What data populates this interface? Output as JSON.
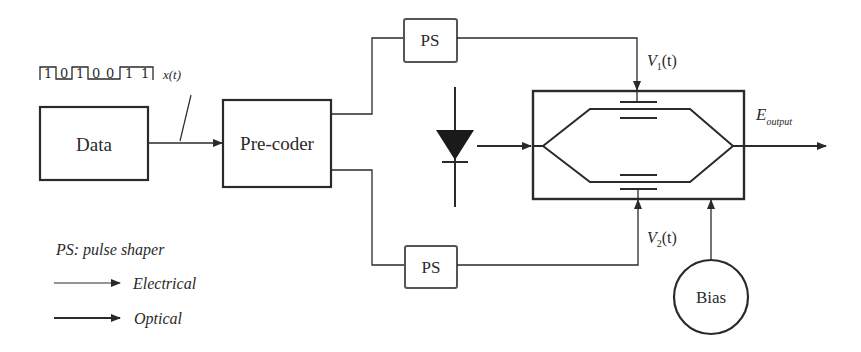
{
  "blocks": {
    "data": "Data",
    "precoder": "Pre-coder",
    "ps_top": "PS",
    "ps_bottom": "PS",
    "bias": "Bias"
  },
  "signals": {
    "bit_sequence": [
      "1",
      "0",
      "1",
      "0",
      "0",
      "1",
      "1"
    ],
    "x_label": "x(t)",
    "v1_main": "V",
    "v1_sub": "1",
    "v1_tail": "(t)",
    "v2_main": "V",
    "v2_sub": "2",
    "v2_tail": "(t)",
    "eout_main": "E",
    "eout_sub": "output"
  },
  "legend": {
    "ps_note": "PS: pulse shaper",
    "electrical": "Electrical",
    "optical": "Optical"
  },
  "colors": {
    "stroke": "#2a2a2a",
    "background": "#ffffff"
  }
}
